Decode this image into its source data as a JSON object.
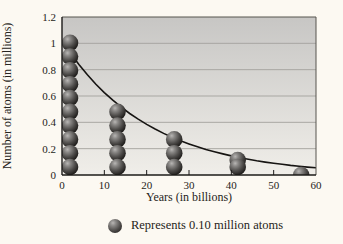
{
  "page": {
    "background": "#fcf9f2"
  },
  "chart_data": {
    "type": "line",
    "title": "",
    "xlabel": "Years (in billions)",
    "ylabel": "Number of atoms (in millions)",
    "xlim": [
      0,
      60
    ],
    "ylim": [
      0,
      1.2
    ],
    "x_ticks": [
      0,
      10,
      20,
      30,
      40,
      50,
      60
    ],
    "x_tick_labels": [
      "0",
      "10",
      "20",
      "30",
      "40",
      "50",
      "60"
    ],
    "y_ticks": [
      0,
      0.2,
      0.4,
      0.6,
      0.8,
      1,
      1.2
    ],
    "y_tick_labels": [
      "0",
      "0.2",
      "0.4",
      "0.6",
      "0.8",
      "1",
      "1.2"
    ],
    "grid": "horizontal",
    "legend_position": "bottom",
    "plot_bg_top": "#c7c6c4",
    "plot_bg_bottom": "#f0eee9",
    "grid_color": "#a3a19d",
    "axis_color": "#1c1b19",
    "frame_color": "#56544f",
    "curve": {
      "name": "radioactive-decay-curve",
      "color": "#161412",
      "points": [
        [
          0,
          1.02
        ],
        [
          2,
          0.925
        ],
        [
          4,
          0.839
        ],
        [
          6,
          0.761
        ],
        [
          8,
          0.69
        ],
        [
          10,
          0.626
        ],
        [
          12,
          0.568
        ],
        [
          14,
          0.515
        ],
        [
          16,
          0.467
        ],
        [
          18,
          0.424
        ],
        [
          20,
          0.384
        ],
        [
          22,
          0.349
        ],
        [
          24,
          0.316
        ],
        [
          26,
          0.287
        ],
        [
          28,
          0.26
        ],
        [
          30,
          0.236
        ],
        [
          32,
          0.214
        ],
        [
          34,
          0.194
        ],
        [
          36,
          0.176
        ],
        [
          38,
          0.16
        ],
        [
          40,
          0.145
        ],
        [
          42,
          0.131
        ],
        [
          44,
          0.119
        ],
        [
          46,
          0.108
        ],
        [
          48,
          0.098
        ],
        [
          50,
          0.089
        ],
        [
          52,
          0.081
        ],
        [
          54,
          0.073
        ],
        [
          56,
          0.066
        ],
        [
          58,
          0.06
        ],
        [
          60,
          0.055
        ]
      ]
    },
    "marker_value": 0.1,
    "marker_unit": "million atoms",
    "atom_stacks": [
      {
        "x": 1.9,
        "markers": 10,
        "value": 1.0
      },
      {
        "x": 13.1,
        "markers": 5,
        "value": 0.5
      },
      {
        "x": 26.5,
        "markers": 3,
        "value": 0.3
      },
      {
        "x": 41.5,
        "markers": 1.5,
        "value": 0.15
      },
      {
        "x": 56.5,
        "markers": 0.5,
        "value": 0.05
      }
    ]
  },
  "legend": {
    "label": "Represents 0.10 million atoms"
  },
  "colors": {
    "sphere_highlight": "#b8b6b4",
    "sphere_mid": "#4d4b49",
    "sphere_dark": "#12100e"
  }
}
